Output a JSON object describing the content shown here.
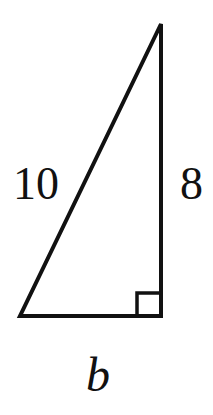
{
  "diagram": {
    "type": "right-triangle",
    "labels": {
      "hypotenuse": "10",
      "vertical_leg": "8",
      "base": "b"
    },
    "right_angle_marker": true,
    "stroke_color": "#111111",
    "background": "#ffffff"
  }
}
